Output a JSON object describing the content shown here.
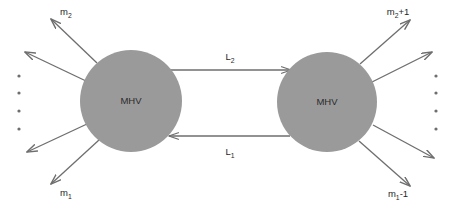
{
  "diagram": {
    "background_color": "#ffffff",
    "node_fill_color": "#9a9a9a",
    "line_color": "#6e6e6e",
    "text_color": "#1f1f1f",
    "nodes": [
      {
        "id": "mhv-left",
        "label": "MHV",
        "cx": 131,
        "cy": 101,
        "r": 51
      },
      {
        "id": "mhv-right",
        "label": "MHV",
        "cx": 327,
        "cy": 102,
        "r": 50
      }
    ],
    "links": [
      {
        "id": "link-top",
        "label": "L",
        "label_sub": "2",
        "direction": "right",
        "x1": 168,
        "x2": 291,
        "y": 70,
        "label_x": 230,
        "label_y": 60
      },
      {
        "id": "link-bottom",
        "label": "L",
        "label_sub": "1",
        "direction": "left",
        "x1": 290,
        "x2": 169,
        "y": 136,
        "label_x": 230,
        "label_y": 155
      }
    ],
    "rays": [
      {
        "id": "ray-left-top-1",
        "node": "mhv-left",
        "label": "m",
        "label_sub": "2",
        "label_suffix": "",
        "x1": 97,
        "y1": 63,
        "x2": 51,
        "y2": 19,
        "label_x": 60,
        "label_y": 15
      },
      {
        "id": "ray-left-top-2",
        "node": "mhv-left",
        "label": "",
        "label_sub": "",
        "label_suffix": "",
        "x1": 86,
        "y1": 81,
        "x2": 25,
        "y2": 52,
        "label_x": 0,
        "label_y": 0
      },
      {
        "id": "ray-left-bottom-1",
        "node": "mhv-left",
        "label": "",
        "label_sub": "",
        "label_suffix": "",
        "x1": 87,
        "y1": 124,
        "x2": 27,
        "y2": 152,
        "label_x": 0,
        "label_y": 0
      },
      {
        "id": "ray-left-bottom-2",
        "node": "mhv-left",
        "label": "m",
        "label_sub": "1",
        "label_suffix": "",
        "x1": 99,
        "y1": 140,
        "x2": 51,
        "y2": 184,
        "label_x": 60,
        "label_y": 196
      },
      {
        "id": "ray-right-top-1",
        "node": "mhv-right",
        "label": "m",
        "label_sub": "2",
        "label_suffix": "+1",
        "x1": 360,
        "y1": 64,
        "x2": 410,
        "y2": 20,
        "label_x": 398,
        "label_y": 15
      },
      {
        "id": "ray-right-top-2",
        "node": "mhv-right",
        "label": "",
        "label_sub": "",
        "label_suffix": "",
        "x1": 372,
        "y1": 82,
        "x2": 432,
        "y2": 52,
        "label_x": 0,
        "label_y": 0
      },
      {
        "id": "ray-right-bottom-1",
        "node": "mhv-right",
        "label": "",
        "label_sub": "",
        "label_suffix": "",
        "x1": 373,
        "y1": 125,
        "x2": 434,
        "y2": 158,
        "label_x": 0,
        "label_y": 0
      },
      {
        "id": "ray-right-bottom-2",
        "node": "mhv-right",
        "label": "m",
        "label_sub": "1",
        "label_suffix": "-1",
        "x1": 359,
        "y1": 141,
        "x2": 410,
        "y2": 186,
        "label_x": 398,
        "label_y": 197
      }
    ],
    "ellipsis_left": {
      "x": 19,
      "dots_y": [
        76,
        93,
        111,
        129
      ],
      "radius": 1.6
    },
    "ellipsis_right": {
      "x": 436,
      "dots_y": [
        76,
        93,
        111,
        129
      ],
      "radius": 1.6
    }
  }
}
